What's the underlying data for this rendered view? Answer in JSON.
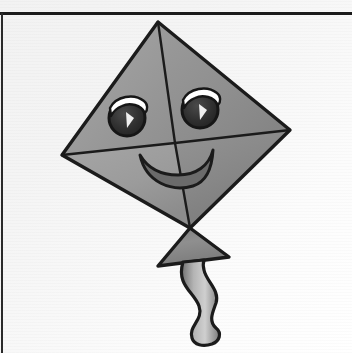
{
  "canvas": {
    "width": 352,
    "height": 353,
    "background_color": "#f4f4f4",
    "background_color_light": "#ffffff",
    "description": "Scanned line-art drawing of a smiling kite on light gray paper"
  },
  "rules": {
    "top_rule": {
      "name": "top-horizontal-rule",
      "color": "#1a1a1a",
      "x1": 0,
      "y1": 13,
      "x2": 352,
      "y2": 13,
      "thickness": 3
    },
    "left_rule": {
      "name": "left-vertical-rule",
      "color": "#2a2a2a",
      "x1": 2,
      "y1": 13,
      "x2": 2,
      "y2": 353,
      "thickness": 2
    }
  },
  "artwork": {
    "title": "Smiling Kite",
    "outline_color": "#1b1b1b",
    "outline_width": 3,
    "kite": {
      "name": "kite-body",
      "vertices": {
        "top": [
          158,
          22
        ],
        "left": [
          62,
          155
        ],
        "right": [
          290,
          130
        ],
        "bottom": [
          190,
          228
        ]
      },
      "quadrant_fills": {
        "upper_left": "#9a9a9a",
        "upper_right": "#8f8f8f",
        "lower_left": "#a0a0a0",
        "lower_right": "#8a8a8a"
      },
      "spine": {
        "name": "kite-spine",
        "from": [
          158,
          22
        ],
        "to": [
          190,
          228
        ]
      },
      "crossbar": {
        "name": "kite-crossbar",
        "from": [
          62,
          155
        ],
        "to": [
          290,
          130
        ]
      }
    },
    "face": {
      "left_eye": {
        "name": "left-eye",
        "center": [
          127,
          118
        ],
        "radius": 18,
        "pupil_color": "#2b2b2b",
        "highlight_color": "#ffffff"
      },
      "right_eye": {
        "name": "right-eye",
        "center": [
          200,
          110
        ],
        "radius": 18,
        "pupil_color": "#2b2b2b",
        "highlight_color": "#ffffff"
      },
      "smile": {
        "name": "smile",
        "left_corner": [
          140,
          156
        ],
        "right_corner": [
          212,
          150
        ],
        "bottom": [
          176,
          186
        ],
        "fill_color": "#6e6e6e",
        "outline_color": "#1b1b1b"
      }
    },
    "bow": {
      "name": "kite-bow",
      "apex": [
        190,
        228
      ],
      "left_corner": [
        158,
        266
      ],
      "right_corner": [
        229,
        257
      ],
      "fill_color": "#8d8d8d"
    },
    "tail": {
      "name": "kite-tail",
      "start": [
        196,
        262
      ],
      "end": [
        210,
        345
      ],
      "fill_color": "#9d9d9d",
      "outline_color": "#1b1b1b",
      "shape": "wavy-ribbon"
    }
  }
}
